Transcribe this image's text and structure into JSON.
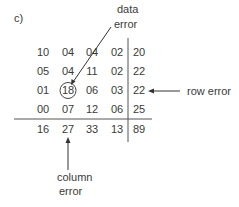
{
  "figure": {
    "panel_label": "c)",
    "annotations": {
      "data_error": [
        "data",
        "error"
      ],
      "row_error": "row error",
      "column_error": [
        "column",
        "error"
      ]
    },
    "grid": {
      "rows": [
        [
          "10",
          "04",
          "04",
          "02",
          "20"
        ],
        [
          "05",
          "04",
          "11",
          "02",
          "22"
        ],
        [
          "01",
          "18",
          "06",
          "03",
          "22"
        ],
        [
          "00",
          "07",
          "12",
          "06",
          "25"
        ]
      ],
      "totals": [
        "16",
        "27",
        "33",
        "13",
        "89"
      ]
    },
    "highlighted_cell": {
      "row": 2,
      "col": 1,
      "value": "18"
    },
    "colors": {
      "ink": "#3a3a3a",
      "line": "#555555",
      "background": "#ffffff"
    }
  }
}
